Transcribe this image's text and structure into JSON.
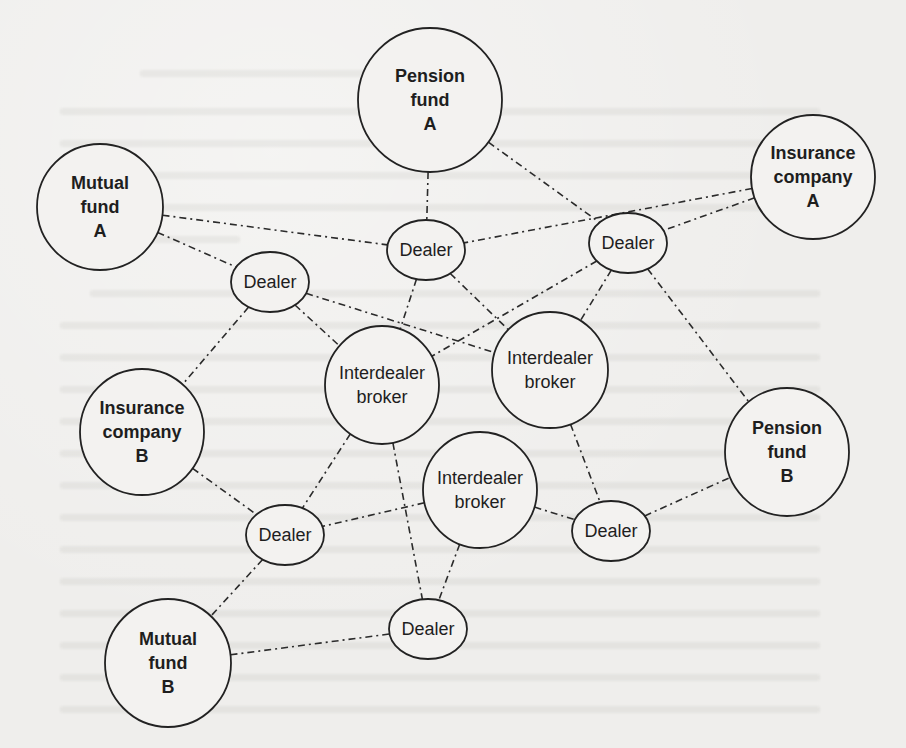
{
  "diagram": {
    "title": "",
    "nodes": [
      {
        "id": "pension_fund_a",
        "type": "client",
        "lines": [
          "Pension",
          "fund",
          "A"
        ],
        "cx": 430,
        "cy": 100,
        "rx": 72,
        "ry": 72
      },
      {
        "id": "mutual_fund_a",
        "type": "client",
        "lines": [
          "Mutual",
          "fund",
          "A"
        ],
        "cx": 100,
        "cy": 207,
        "rx": 63,
        "ry": 63
      },
      {
        "id": "insurance_company_a",
        "type": "client",
        "lines": [
          "Insurance",
          "company",
          "A"
        ],
        "cx": 813,
        "cy": 177,
        "rx": 62,
        "ry": 62
      },
      {
        "id": "dealer_top_center",
        "type": "dealer",
        "lines": [
          "Dealer"
        ],
        "cx": 426,
        "cy": 250,
        "rx": 39,
        "ry": 30
      },
      {
        "id": "dealer_top_right",
        "type": "dealer",
        "lines": [
          "Dealer"
        ],
        "cx": 628,
        "cy": 243,
        "rx": 39,
        "ry": 30
      },
      {
        "id": "dealer_left",
        "type": "dealer",
        "lines": [
          "Dealer"
        ],
        "cx": 270,
        "cy": 282,
        "rx": 39,
        "ry": 30
      },
      {
        "id": "interdealer_broker_center",
        "type": "broker",
        "lines": [
          "Interdealer",
          "broker"
        ],
        "cx": 382,
        "cy": 385,
        "rx": 57,
        "ry": 59
      },
      {
        "id": "interdealer_broker_right",
        "type": "broker",
        "lines": [
          "Interdealer",
          "broker"
        ],
        "cx": 550,
        "cy": 370,
        "rx": 58,
        "ry": 58
      },
      {
        "id": "insurance_company_b",
        "type": "client",
        "lines": [
          "Insurance",
          "company",
          "B"
        ],
        "cx": 142,
        "cy": 432,
        "rx": 62,
        "ry": 63
      },
      {
        "id": "pension_fund_b",
        "type": "client",
        "lines": [
          "Pension",
          "fund",
          "B"
        ],
        "cx": 787,
        "cy": 452,
        "rx": 62,
        "ry": 64
      },
      {
        "id": "interdealer_broker_lower",
        "type": "broker",
        "lines": [
          "Interdealer",
          "broker"
        ],
        "cx": 480,
        "cy": 490,
        "rx": 57,
        "ry": 58
      },
      {
        "id": "dealer_lower_left",
        "type": "dealer",
        "lines": [
          "Dealer"
        ],
        "cx": 285,
        "cy": 535,
        "rx": 39,
        "ry": 30
      },
      {
        "id": "dealer_lower_right",
        "type": "dealer",
        "lines": [
          "Dealer"
        ],
        "cx": 611,
        "cy": 531,
        "rx": 39,
        "ry": 30
      },
      {
        "id": "mutual_fund_b",
        "type": "client",
        "lines": [
          "Mutual",
          "fund",
          "B"
        ],
        "cx": 168,
        "cy": 663,
        "rx": 63,
        "ry": 64
      },
      {
        "id": "dealer_bottom",
        "type": "dealer",
        "lines": [
          "Dealer"
        ],
        "cx": 428,
        "cy": 629,
        "rx": 39,
        "ry": 30
      }
    ],
    "edges": [
      [
        "pension_fund_a",
        "dealer_top_center"
      ],
      [
        "pension_fund_a",
        "dealer_top_right"
      ],
      [
        "mutual_fund_a",
        "dealer_top_center"
      ],
      [
        "mutual_fund_a",
        "dealer_left"
      ],
      [
        "insurance_company_a",
        "dealer_top_center"
      ],
      [
        "insurance_company_a",
        "dealer_top_right"
      ],
      [
        "dealer_left",
        "interdealer_broker_right"
      ],
      [
        "dealer_left",
        "interdealer_broker_center"
      ],
      [
        "dealer_left",
        "insurance_company_b"
      ],
      [
        "dealer_top_center",
        "interdealer_broker_center"
      ],
      [
        "dealer_top_center",
        "interdealer_broker_right"
      ],
      [
        "dealer_top_right",
        "interdealer_broker_center"
      ],
      [
        "dealer_top_right",
        "interdealer_broker_right"
      ],
      [
        "dealer_top_right",
        "pension_fund_b"
      ],
      [
        "insurance_company_b",
        "dealer_lower_left"
      ],
      [
        "interdealer_broker_center",
        "dealer_lower_left"
      ],
      [
        "interdealer_broker_center",
        "dealer_bottom"
      ],
      [
        "interdealer_broker_lower",
        "dealer_lower_left"
      ],
      [
        "interdealer_broker_lower",
        "dealer_lower_right"
      ],
      [
        "interdealer_broker_lower",
        "dealer_bottom"
      ],
      [
        "interdealer_broker_right",
        "dealer_lower_right"
      ],
      [
        "dealer_lower_right",
        "pension_fund_b"
      ],
      [
        "dealer_lower_left",
        "mutual_fund_b"
      ],
      [
        "mutual_fund_b",
        "dealer_bottom"
      ]
    ]
  },
  "colors": {
    "paper": "#efeeec",
    "ink": "#222222",
    "node_fill": "#f3f2f0"
  }
}
